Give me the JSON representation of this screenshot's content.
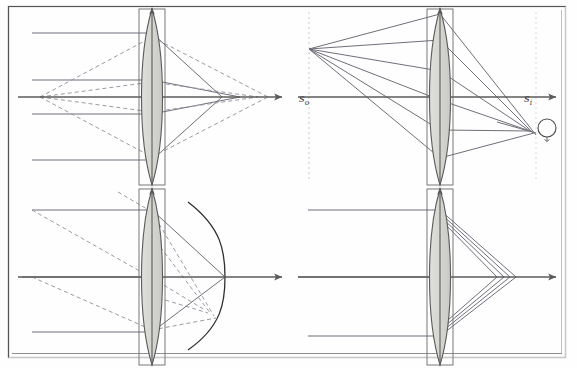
{
  "figure": {
    "canvas": {
      "width": 577,
      "height": 368,
      "background": "#fefefe"
    },
    "frame": {
      "name": "figure-border",
      "x": 8,
      "y": 6,
      "width": 558,
      "height": 352,
      "dark_color": "#4a4a4a",
      "light_color": "#c9c9c9"
    },
    "labels": {
      "object_distance": "s",
      "object_distance_sub": "o",
      "image_distance": "s",
      "image_distance_sub": "i"
    },
    "colors": {
      "axis": "#5b5b5b",
      "ray_solid": "#6f6f7a",
      "ray_dashed": "#9a9aa4",
      "lens_outline": "#5a5a5a",
      "lens_fill": "#d8d8d4",
      "lens_fill_dark": "#cdcdc8",
      "focal_surface": "#2f2f2f",
      "guide_dotted": "#d6d6d6",
      "blur_circle": "#4a4a4a",
      "label_text": "#3a3a3a"
    },
    "panels": [
      {
        "id": "top-left",
        "name": "panel-spherical-aberration",
        "aberration": "spherical aberration",
        "lens_center_x": 152,
        "axis_y": 97,
        "parallel_ray_heights": [
          33,
          80,
          114,
          160
        ],
        "axial_source_x": 40,
        "focus_spread_x": [
          222,
          268
        ],
        "has_dashed_rays": true,
        "has_focal_surface": false,
        "has_blur_circle": false
      },
      {
        "id": "top-right",
        "name": "panel-coma-blur-circle",
        "aberration": "coma / off-axis blur",
        "lens_center_x": 440,
        "axis_y": 97,
        "object_point": {
          "x": 309,
          "y": 49
        },
        "object_plane_x": 309,
        "image_plane_x": 536,
        "blur_circle": {
          "cx": 546,
          "cy": 128,
          "r": 9
        },
        "has_dashed_rays": false,
        "has_focal_surface": false,
        "has_blur_circle": true
      },
      {
        "id": "bottom-left",
        "name": "panel-field-curvature",
        "aberration": "field curvature (Petzval surface)",
        "lens_center_x": 152,
        "axis_y": 277,
        "parallel_ray_heights": [
          210,
          277,
          332
        ],
        "axial_source_x": 30,
        "focal_surface": {
          "vertex_x": 225,
          "sag_x": 188,
          "top_y": 202,
          "bottom_y": 350
        },
        "has_dashed_rays": true,
        "has_focal_surface": true,
        "has_blur_circle": false
      },
      {
        "id": "bottom-right",
        "name": "panel-longitudinal-aberration",
        "aberration": "longitudinal / chromatic aberration",
        "lens_center_x": 440,
        "axis_y": 277,
        "parallel_ray_heights": [
          210,
          277,
          336
        ],
        "focus_points_x": [
          497,
          504,
          510,
          516
        ],
        "has_dashed_rays": false,
        "has_focal_surface": false,
        "has_blur_circle": false
      }
    ],
    "lens": {
      "name": "biconvex-lens",
      "half_height": 88,
      "half_width": 13,
      "bulge": 13,
      "has_vertical_axis_arrow": true
    }
  }
}
